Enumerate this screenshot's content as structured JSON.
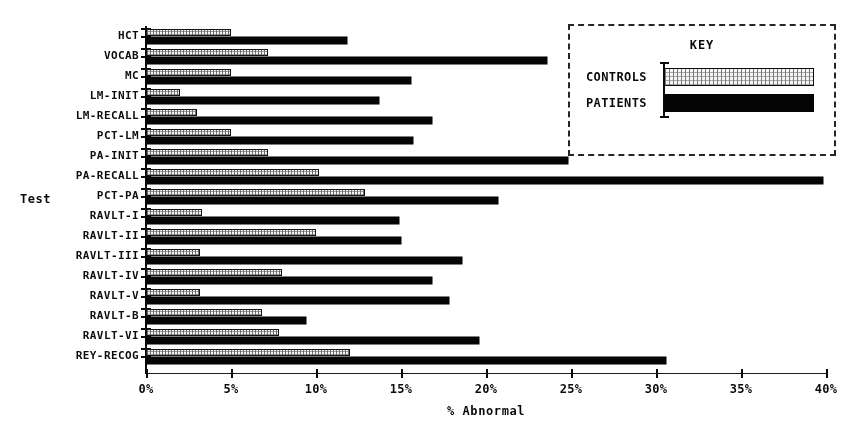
{
  "chart_data": {
    "type": "bar",
    "orientation": "horizontal",
    "title": "",
    "xlabel": "% Abnormal",
    "ylabel": "Test",
    "xlim": [
      0,
      40
    ],
    "xtick_labels": [
      "0%",
      "5%",
      "10%",
      "15%",
      "20%",
      "25%",
      "30%",
      "35%",
      "40%"
    ],
    "xticks": [
      0,
      5,
      10,
      15,
      20,
      25,
      30,
      35,
      40
    ],
    "grid": false,
    "legend": {
      "title": "KEY",
      "position": "top-right",
      "entries": [
        {
          "name": "CONTROLS",
          "style": "stippled-light",
          "color": "#efefef"
        },
        {
          "name": "PATIENTS",
          "style": "solid-black",
          "color": "#0a0a0a"
        }
      ]
    },
    "categories": [
      "HCT",
      "VOCAB",
      "MC",
      "LM-INIT",
      "LM-RECALL",
      "PCT-LM",
      "PA-INIT",
      "PA-RECALL",
      "PCT-PA",
      "RAVLT-I",
      "RAVLT-II",
      "RAVLT-III",
      "RAVLT-IV",
      "RAVLT-V",
      "RAVLT-B",
      "RAVLT-VI",
      "REY-RECOG"
    ],
    "series": [
      {
        "name": "CONTROLS",
        "values": [
          5.0,
          7.2,
          5.0,
          2.0,
          3.0,
          5.0,
          7.2,
          10.2,
          12.9,
          3.3,
          10.0,
          3.2,
          8.0,
          3.2,
          6.8,
          7.8,
          12.0
        ]
      },
      {
        "name": "PATIENTS",
        "values": [
          11.8,
          23.6,
          15.6,
          13.7,
          16.8,
          15.7,
          24.8,
          39.8,
          20.7,
          14.9,
          15.0,
          18.6,
          16.8,
          17.8,
          9.4,
          19.6,
          30.6
        ]
      }
    ]
  }
}
